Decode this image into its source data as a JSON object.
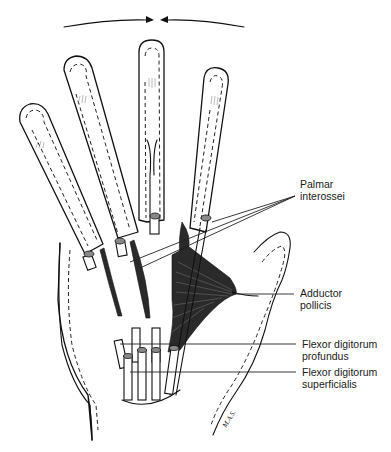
{
  "figure": {
    "motion_arrows": {
      "description": "Two curved arrows converging toward the midline of the middle finger (adduction)",
      "left_arrow_direction": "right",
      "right_arrow_direction": "left"
    }
  },
  "labels": [
    {
      "id": "palmar-interossei",
      "line1": "Palmar",
      "line2": "interossei"
    },
    {
      "id": "adductor-pollicis",
      "line1": "Adductor",
      "line2": "pollicis"
    },
    {
      "id": "flexor-digitorum-profundus",
      "line1": "Flexor digitorum",
      "line2": "profundus"
    },
    {
      "id": "flexor-digitorum-superficialis",
      "line1": "Flexor digitorum",
      "line2": "superficialis"
    }
  ],
  "signature": "M.A.S."
}
